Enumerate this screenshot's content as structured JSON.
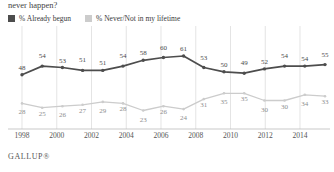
{
  "title": "never happen?",
  "footer": "GALLUP®",
  "legend": {
    "position": "top-left",
    "entries": [
      {
        "label": "% Already begun",
        "color": "#4d4d4d",
        "swatch": "dark"
      },
      {
        "label": "% Never/Not in my lifetime",
        "color": "#cccccc",
        "swatch": "light"
      }
    ]
  },
  "chart_data": {
    "type": "line",
    "title": "never happen?",
    "xlabel": "",
    "ylabel": "",
    "ylim": [
      0,
      70
    ],
    "grid": "vertical",
    "x": [
      1998,
      2000,
      2001,
      2002,
      2003,
      2004,
      2005,
      2006,
      2007,
      2008,
      2009,
      2010,
      2011,
      2012,
      2013,
      2014
    ],
    "tick_labels": [
      "1998",
      "2000",
      "2002",
      "2004",
      "2006",
      "2008",
      "2010",
      "2012",
      "2014"
    ],
    "series": [
      {
        "name": "% Already begun",
        "color": "#4d4d4d",
        "values": [
          48,
          54,
          53,
          51,
          51,
          54,
          58,
          60,
          61,
          53,
          50,
          49,
          52,
          54,
          54,
          55
        ]
      },
      {
        "name": "% Never/Not in my lifetime",
        "color": "#cccccc",
        "values": [
          28,
          25,
          26,
          27,
          29,
          28,
          23,
          26,
          24,
          31,
          35,
          35,
          30,
          30,
          34,
          33
        ]
      }
    ]
  }
}
